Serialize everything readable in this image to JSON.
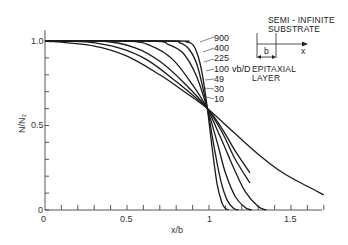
{
  "chart_data": {
    "type": "line",
    "title": "",
    "xlabel": "x/b",
    "ylabel": "N/N₂",
    "xlim": [
      0,
      1.7
    ],
    "ylim": [
      0,
      1.0
    ],
    "grid": false,
    "x_ticks": [
      {
        "value": 0,
        "label": "0"
      },
      {
        "value": 0.5,
        "label": "0.5"
      },
      {
        "value": 1,
        "label": "1"
      },
      {
        "value": 1.5,
        "label": "1.5"
      }
    ],
    "y_ticks": [
      {
        "value": 0,
        "label": "0"
      },
      {
        "value": 0.5,
        "label": "0.5"
      },
      {
        "value": 1.0,
        "label": "1.0"
      }
    ],
    "parameter_label": "vb/D",
    "series": [
      {
        "name": "900",
        "x": [
          0,
          0.8,
          0.86,
          0.9,
          0.93,
          0.96,
          0.99,
          1.02,
          1.05,
          1.08,
          1.1,
          1.12
        ],
        "values": [
          1.0,
          1.0,
          0.995,
          0.98,
          0.92,
          0.8,
          0.6,
          0.36,
          0.15,
          0.04,
          0.01,
          0.0
        ]
      },
      {
        "name": "400",
        "x": [
          0,
          0.74,
          0.82,
          0.88,
          0.93,
          0.99,
          1.03,
          1.07,
          1.11,
          1.15,
          1.18
        ],
        "values": [
          1.0,
          1.0,
          0.99,
          0.95,
          0.85,
          0.6,
          0.38,
          0.18,
          0.06,
          0.01,
          0.0
        ]
      },
      {
        "name": "225",
        "x": [
          0,
          0.65,
          0.75,
          0.84,
          0.92,
          0.99,
          1.05,
          1.1,
          1.16,
          1.22,
          1.26
        ],
        "values": [
          1.0,
          1.0,
          0.98,
          0.93,
          0.8,
          0.6,
          0.4,
          0.22,
          0.08,
          0.015,
          0.0
        ]
      },
      {
        "name": "100",
        "x": [
          0,
          0.5,
          0.65,
          0.78,
          0.9,
          0.99,
          1.07,
          1.15,
          1.22,
          1.3,
          1.35
        ],
        "values": [
          1.0,
          1.0,
          0.97,
          0.89,
          0.74,
          0.6,
          0.43,
          0.25,
          0.11,
          0.02,
          0.0
        ]
      },
      {
        "name": "49",
        "x": [
          0,
          0.35,
          0.55,
          0.7,
          0.85,
          0.99,
          1.08,
          1.16,
          1.25
        ],
        "values": [
          1.0,
          1.0,
          0.96,
          0.88,
          0.75,
          0.6,
          0.46,
          0.3,
          0.16
        ]
      },
      {
        "name": "30",
        "x": [
          0,
          0.25,
          0.45,
          0.62,
          0.8,
          0.99,
          1.08,
          1.16,
          1.25
        ],
        "values": [
          1.0,
          0.995,
          0.96,
          0.89,
          0.76,
          0.6,
          0.48,
          0.35,
          0.22
        ]
      },
      {
        "name": "10",
        "x": [
          0,
          0.3,
          0.5,
          0.7,
          0.85,
          0.99,
          1.15,
          1.3,
          1.45,
          1.6,
          1.7
        ],
        "values": [
          1.0,
          0.97,
          0.91,
          0.8,
          0.7,
          0.6,
          0.46,
          0.33,
          0.22,
          0.14,
          0.09
        ]
      }
    ],
    "annotations": [
      "SEMI - INFINITE SUBSTRATE",
      "EPITAXIAL LAYER",
      "b",
      "x"
    ]
  },
  "axes": {
    "y_title": "N/N₂",
    "x_title": "x/b",
    "y_tick_labels": [
      "1.0",
      "0.5",
      "0"
    ],
    "x_tick_labels": [
      "0",
      "0.5",
      "1",
      "1.5"
    ]
  },
  "curve_labels": [
    "900",
    "400",
    "225",
    "100",
    "49",
    "30",
    "10"
  ],
  "parameter_label": "vb/D",
  "inset": {
    "substrate_line1": "SEMI - INFINITE",
    "substrate_line2": "SUBSTRATE",
    "layer_line1": "EPITAXIAL",
    "layer_line2": "LAYER",
    "b_label": "b",
    "x_label": "x"
  },
  "colors": {
    "line": "#1a1a1a",
    "axis": "#444444",
    "text": "#333333",
    "background": "#ffffff"
  }
}
